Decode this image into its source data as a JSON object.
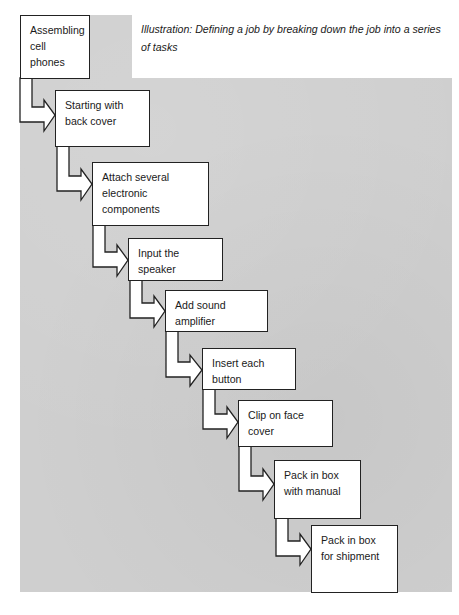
{
  "caption": {
    "text": "Illustration:  Defining a job by breaking down the job into a series of tasks"
  },
  "diagram": {
    "type": "step-flow",
    "colors": {
      "background": "#cfcfcf",
      "box_fill": "#ffffff",
      "outline": "#222222"
    },
    "steps": [
      {
        "label": "Assembling cell phones"
      },
      {
        "label": "Starting with back cover"
      },
      {
        "label": "Attach several electronic components"
      },
      {
        "label": "Input the speaker"
      },
      {
        "label": "Add sound amplifier"
      },
      {
        "label": "Insert each button"
      },
      {
        "label": "Clip on face cover"
      },
      {
        "label": "Pack in box with manual"
      },
      {
        "label": "Pack in box for shipment"
      }
    ]
  }
}
